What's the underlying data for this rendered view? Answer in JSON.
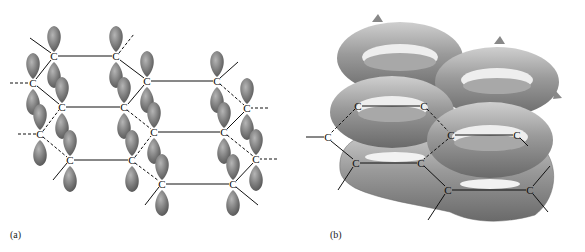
{
  "figure": {
    "panels": [
      {
        "id": "a",
        "label": "(a)",
        "description": "Stacked layers of sp2 carbon hexagons with unhybridized p orbitals (lobes above and below each carbon)",
        "atom_symbol": "C",
        "atom_count": 16
      },
      {
        "id": "b",
        "label": "(b)",
        "description": "Delocalized pi-electron clouds forming ring-shaped tori above and below the carbon hexagon layer",
        "atom_symbol": "C",
        "atom_count": 9
      }
    ],
    "colors": {
      "orbital_fill": "#7a7a7a",
      "orbital_highlight": "#b5b5b5",
      "cloud_fill": "#9a9a9a",
      "bond_line": "#111111",
      "background": "#ffffff"
    }
  }
}
